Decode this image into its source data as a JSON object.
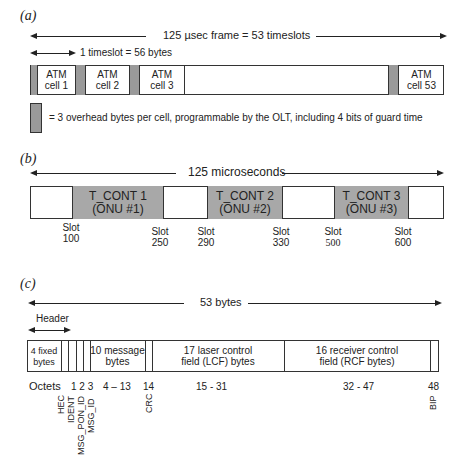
{
  "panel_a": {
    "label": "(a)",
    "frame_text": "125 µsec frame = 53 timeslots",
    "timeslot_text": "1 timeslot = 56 bytes",
    "cells": [
      {
        "line1": "ATM",
        "line2": "cell  1"
      },
      {
        "line1": "ATM",
        "line2": "cell 2"
      },
      {
        "line1": "ATM",
        "line2": "cell  3"
      },
      {
        "line1": "ATM",
        "line2": "cell  53"
      }
    ],
    "legend_text": "= 3 overhead bytes per cell, programmable by the OLT, including 4 bits of guard time",
    "overhead_color": "#9a9a9a"
  },
  "panel_b": {
    "label": "(b)",
    "duration_text": "125 microseconds",
    "tconts": [
      {
        "line1": "T_CONT 1",
        "line2": "(ONU #1)"
      },
      {
        "line1": "T_CONT 2",
        "line2": "(ONU #2)"
      },
      {
        "line1": "T_CONT 3",
        "line2": "(ONU #3)"
      }
    ],
    "slots": [
      {
        "word": "Slot",
        "num": "100"
      },
      {
        "word": "Slot",
        "num": "250"
      },
      {
        "word": "Slot",
        "num": "290"
      },
      {
        "word": "Slot",
        "num": "330"
      },
      {
        "word": "Slot",
        "num": "500"
      },
      {
        "word": "Slot",
        "num": "600"
      }
    ],
    "tcont_color": "#a8a8a8"
  },
  "panel_c": {
    "label": "(c)",
    "total_text": "53 bytes",
    "header_text": "Header",
    "fields": [
      {
        "line1": "4 fixed",
        "line2": "bytes"
      },
      {
        "line1": "10 message",
        "line2": "bytes"
      },
      {
        "line1": "17 laser control",
        "line2": "field (LCF) bytes"
      },
      {
        "line1": "16 receiver control",
        "line2": "field (RCF bytes)"
      }
    ],
    "octets": {
      "label": "Octets",
      "o123": "1 2 3",
      "o4_13": "4 – 13",
      "o14": "14",
      "o15_31": "15 - 31",
      "o32_47": "32 - 47",
      "o48": "48"
    },
    "rotated_labels": {
      "hec": "HEC",
      "ident": "IDENT",
      "msg_pon_id": "MSG_PON_ID",
      "msg_id": "MSG_ID",
      "crc": "CRC",
      "bip": "BIP"
    }
  }
}
